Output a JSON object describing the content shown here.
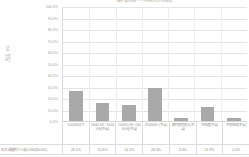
{
  "chart_data": {
    "type": "bar",
    "title": "图3 受访者个人月收入分布情况",
    "xlabel": "",
    "ylabel": "占比（%）",
    "ylim": [
      0,
      100
    ],
    "ytick_labels": [
      "100.0%",
      "90.0%",
      "80.0%",
      "70.0%",
      "60.0%",
      "50.0%",
      "40.0%",
      "30.0%",
      "20.0%",
      "10.0%",
      "0.0%"
    ],
    "ytick_values": [
      100,
      90,
      80,
      70,
      60,
      50,
      40,
      30,
      20,
      10,
      0
    ],
    "grid": true,
    "legend": false,
    "bar_color": "#a9a9a9",
    "categories": [
      "5000元以下",
      "5000.1元~10000元(不含)",
      "10000.1元~15000元(不含)",
      "15000元~(不含)",
      "暂时没有收入(不含)",
      "不知道(不含)",
      "不想告知(不含)"
    ],
    "values": [
      26.5,
      15.6,
      14.3,
      28.4,
      3.0,
      11.9,
      2.4
    ],
    "value_labels": [
      "26.5%",
      "15.6%",
      "14.3%",
      "28.4%",
      "3.0%",
      "11.9%",
      "2.4%"
    ],
    "series_row_header": "本次 调查的个人收入占比(N=311)"
  },
  "table": {
    "row_header": "本次 调查的个人收入占比(N=311)"
  }
}
